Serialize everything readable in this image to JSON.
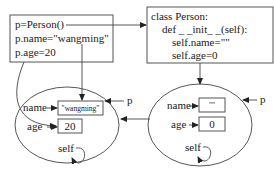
{
  "caller_code": {
    "lines": [
      "p=Person()",
      "p.name=\"wangming\"",
      "p.age=20"
    ]
  },
  "class_code": {
    "lines": [
      "class  Person:",
      "def  _ _init_ _(self):",
      "self.name=\"\"",
      "self.age=0"
    ]
  },
  "left_object": {
    "name_label": "name",
    "name_value": "\"wangming\"",
    "age_label": "age",
    "age_value": "20",
    "self_label": "self",
    "ref_label": "p"
  },
  "right_object": {
    "name_label": "name",
    "name_value": "\"\"",
    "age_label": "age",
    "age_value": "0",
    "self_label": "self",
    "ref_label": "p"
  }
}
